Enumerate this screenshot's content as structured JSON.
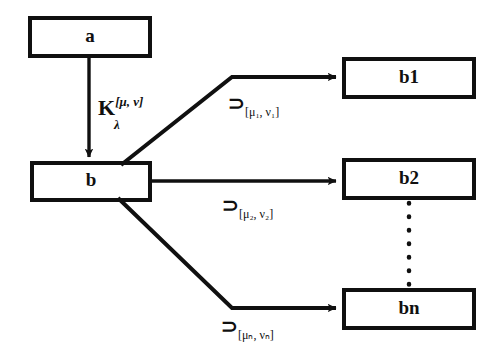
{
  "diagram": {
    "background_color": "#ffffff",
    "stroke_color": "#101010",
    "nodes": [
      {
        "id": "a",
        "label": "a",
        "x": 30,
        "y": 18,
        "w": 120,
        "h": 38
      },
      {
        "id": "b",
        "label": "b",
        "x": 32,
        "y": 163,
        "w": 118,
        "h": 37
      },
      {
        "id": "b1",
        "label": "b1",
        "x": 344,
        "y": 59,
        "w": 130,
        "h": 38
      },
      {
        "id": "b2",
        "label": "b2",
        "x": 344,
        "y": 160,
        "w": 130,
        "h": 38
      },
      {
        "id": "bn",
        "label": "bn",
        "x": 344,
        "y": 290,
        "w": 130,
        "h": 38
      }
    ],
    "kernel_edge": {
      "from": "a",
      "to": "b",
      "label_base": "K",
      "label_superscript": "[μ, ν]",
      "label_subscript": "λ"
    },
    "branch_edges": [
      {
        "from": "b",
        "to": "b1",
        "operator": "⊃",
        "subscript": "[μ₁, ν₁]",
        "label_text": "⊃[μ₁, ν₁]"
      },
      {
        "from": "b",
        "to": "b2",
        "operator": "⊃",
        "subscript": "[μ₂, ν₂]",
        "label_text": "⊃[μ₂, ν₂]"
      },
      {
        "from": "b",
        "to": "bn",
        "operator": "⊃",
        "subscript": "[μₙ, νₙ]",
        "label_text": "⊃[μₙ, νₙ]"
      }
    ],
    "ellipsis": {
      "style": "vertical-dotted",
      "x": 409,
      "y_start": 205,
      "y_end": 284
    }
  }
}
